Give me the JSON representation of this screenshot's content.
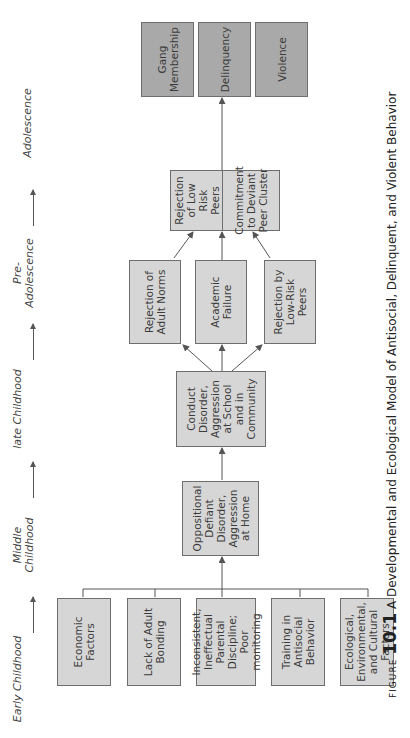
{
  "stages": [
    {
      "id": "early",
      "label": "Early Childhood"
    },
    {
      "id": "middle",
      "label": "Middle Childhood"
    },
    {
      "id": "late",
      "label": "late Childhood"
    },
    {
      "id": "pre",
      "label": "Pre-Adolescence"
    },
    {
      "id": "adol",
      "label": "Adolescence"
    }
  ],
  "nodes": {
    "early": [
      {
        "label": "Economic Factors"
      },
      {
        "label": "Lack of Adult Bonding"
      },
      {
        "label": "Inconsistent, Ineffectual Parental Discipline; Poor monitoring"
      },
      {
        "label": "Training in Antisocial Behavior"
      },
      {
        "label": "Ecological, Environmental, and Cultural Factors"
      }
    ],
    "middle": {
      "label": "Oppositional Defiant Disorder, Aggression at Home"
    },
    "late": {
      "label": "Conduct Disorder, Aggression at School and in Community"
    },
    "late_outcomes": [
      {
        "label": "Rejection of Adult Norms"
      },
      {
        "label": "Academic Failure"
      },
      {
        "label": "Rejection by Low-Risk Peers"
      }
    ],
    "pre": [
      {
        "label": "Rejection of Low Risk Peers"
      },
      {
        "label": "Commitment to Deviant Peer Cluster"
      }
    ],
    "adolescence": [
      {
        "label": "Gang Membership"
      },
      {
        "label": "Delinquency"
      },
      {
        "label": "Violence"
      }
    ]
  },
  "colors": {
    "light_box": "#d6d6d6",
    "dark_box": "#a9a9a9",
    "border": "#6e6e6e",
    "arrow": "#555555"
  },
  "caption": {
    "prefix": "FIGURE",
    "number": "10.1",
    "text": "A Developmental and Ecological Model of Antisocial, Delinquent, and Violent Behavior"
  }
}
